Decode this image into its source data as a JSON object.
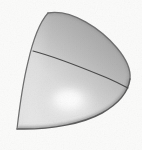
{
  "image": {
    "width": 142,
    "height": 150,
    "background_color": "#fbfbfa",
    "description": "Grayscale shaded 3D render of a quarter-sphere dome solid",
    "caption": "",
    "has_text": false,
    "text_labels": []
  },
  "figure": {
    "name": "quarter-dome-solid",
    "render_style": "smooth-shaded-grayscale",
    "outline_color": "#6f6f6f",
    "seam_color": "#4a4a4a",
    "fill_colors": {
      "darkest": "#a2a2a2",
      "mid": "#c9c9c9",
      "light": "#e8e8e8",
      "highlight": "#fdfdfd",
      "rim_shadow": "#7a7a7a"
    },
    "highlight_center": {
      "x": 70,
      "y": 101
    },
    "geometry": {
      "apex": {
        "x": 48,
        "y": 13
      },
      "rightmost": {
        "x": 130,
        "y": 79
      },
      "bottom_left": {
        "x": 17,
        "y": 129
      },
      "bottom_right_tail": {
        "x": 120,
        "y": 108
      },
      "seam_start": {
        "x": 33,
        "y": 51
      },
      "seam_end": {
        "x": 128,
        "y": 88
      }
    },
    "paths": {
      "body": "M48,13 C72,9 101,29 117,48 C127,60 131,70 130,79 C128,93 118,104 102,113 C84,123 52,130 17,129 C19,112 22,86 28,62 C33,40 40,22 48,13 Z",
      "seam": "M33,51 C52,56 78,66 100,75 C113,80 122,85 128,88",
      "left_edge": "M48,13 C40,22 33,40 28,62 C22,86 19,112 17,129",
      "bottom_edge": "M17,129 C52,130 84,123 102,113 C118,104 128,93 130,79",
      "top_edge": "M48,13 C72,9 101,29 117,48 C127,60 131,70 130,79"
    }
  }
}
